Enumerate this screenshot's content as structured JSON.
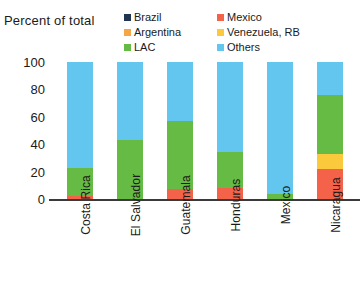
{
  "chart_data": {
    "type": "bar",
    "subtype": "stacked-column",
    "title": "Percent of total",
    "xlabel": "",
    "ylabel": "Percent of total",
    "ylim": [
      0,
      100
    ],
    "yticks": [
      0,
      20,
      40,
      60,
      80,
      100
    ],
    "grid": false,
    "legend_position": "top-right",
    "categories": [
      "Costa Rica",
      "El Salvador",
      "Guatemala",
      "Honduras",
      "Mexico",
      "Nicaragua"
    ],
    "series": [
      {
        "name": "Brazil",
        "color": "#1f3551",
        "values": [
          0,
          0,
          0,
          0,
          0,
          0
        ]
      },
      {
        "name": "Mexico",
        "color": "#f4624a",
        "values": [
          2,
          0,
          7,
          8,
          0,
          22
        ]
      },
      {
        "name": "Argentina",
        "color": "#f5a646",
        "values": [
          0,
          0,
          0,
          0,
          0,
          0
        ]
      },
      {
        "name": "Venezuela, RB",
        "color": "#fac93c",
        "values": [
          0,
          0,
          0,
          0,
          0,
          11
        ]
      },
      {
        "name": "LAC",
        "color": "#66bb44",
        "values": [
          21,
          43,
          50,
          26,
          4,
          43
        ]
      },
      {
        "name": "Others",
        "color": "#63c6ef",
        "values": [
          77,
          57,
          43,
          66,
          96,
          24
        ]
      }
    ]
  },
  "legend": {
    "items": [
      {
        "label": "Brazil",
        "color": "#1f3551"
      },
      {
        "label": "Mexico",
        "color": "#f4624a"
      },
      {
        "label": "Argentina",
        "color": "#f5a646"
      },
      {
        "label": "Venezuela, RB",
        "color": "#fac93c"
      },
      {
        "label": "LAC",
        "color": "#66bb44"
      },
      {
        "label": "Others",
        "color": "#63c6ef"
      }
    ]
  }
}
